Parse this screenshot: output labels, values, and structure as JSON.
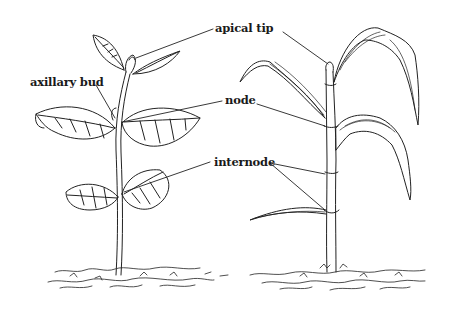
{
  "diagram": {
    "type": "labeled botanical illustration",
    "subjects": [
      "dicot seedling (left)",
      "monocot seedling (right)"
    ],
    "labels": {
      "apical_tip": "apical tip",
      "axillary_bud": "axillary bud",
      "node": "node",
      "internode": "internode"
    },
    "colors": {
      "ink": "#1a1a1a",
      "background": "#ffffff"
    }
  }
}
